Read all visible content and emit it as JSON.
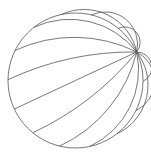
{
  "diagram": {
    "type": "poincare-disk-geodesics",
    "stroke_color": "#555555",
    "background": "#ffffff",
    "disk": {
      "cx": 75.5,
      "cy": 80.5,
      "r": 67.5
    },
    "ideal_point_angle_deg": 25,
    "geodesic_count": 13,
    "geodesic_step_deg": 25.714
  }
}
